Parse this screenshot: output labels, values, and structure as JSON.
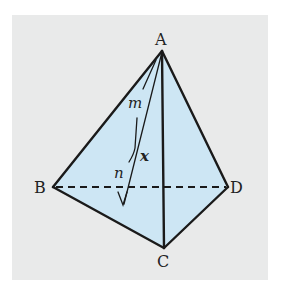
{
  "figure": {
    "type": "tetrahedron",
    "background_color": "#e9eaea",
    "face_color": "#cde6f4",
    "line_color": "#1a1a1a",
    "vertices": {
      "A": {
        "label": "A",
        "x": 162,
        "y": 51
      },
      "B": {
        "label": "B",
        "x": 53,
        "y": 187
      },
      "C": {
        "label": "C",
        "x": 164,
        "y": 248
      },
      "D": {
        "label": "D",
        "x": 228,
        "y": 187
      }
    },
    "edges": [
      {
        "from": "A",
        "to": "B",
        "style": "solid"
      },
      {
        "from": "A",
        "to": "C",
        "style": "solid"
      },
      {
        "from": "A",
        "to": "D",
        "style": "solid"
      },
      {
        "from": "B",
        "to": "C",
        "style": "solid"
      },
      {
        "from": "C",
        "to": "D",
        "style": "solid"
      },
      {
        "from": "B",
        "to": "D",
        "style": "dashed"
      }
    ],
    "annotations": {
      "line_m": "m",
      "line_n": "n",
      "angle_x": "x"
    }
  }
}
